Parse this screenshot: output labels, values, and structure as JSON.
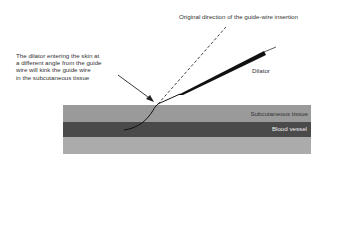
{
  "diagram": {
    "title_label": "Original direction of the guide-wire insertion",
    "annotation_lines": [
      "The dilator entering the skin at",
      "a different angle from the guide",
      "wire will kink the guide wire",
      "in the subcutaneous tissue"
    ],
    "dilator_label": "Dilator",
    "layers": {
      "subcutaneous_label": "Subcutaneous tissue",
      "vessel_label": "Blood vessel"
    },
    "colors": {
      "subcutaneous": "#9a9a9a",
      "vessel": "#4a4a4a",
      "deep_tissue": "#ababab",
      "dilator": "#111111"
    }
  }
}
